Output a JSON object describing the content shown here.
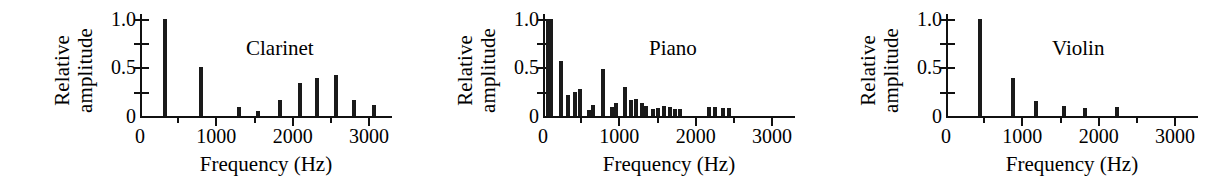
{
  "figure": {
    "background": "#ffffff",
    "ink_color": "#1a1a1a"
  },
  "axis": {
    "ylabel_line1": "Relative",
    "ylabel_line2": "amplitude",
    "xlabel": "Frequency (Hz)",
    "ytick_labels": [
      "1.0",
      "0.5",
      "0"
    ],
    "ytick_values": [
      1.0,
      0.5,
      0
    ],
    "yminor_values": [
      0.75,
      0.25
    ],
    "xtick_labels": [
      "0",
      "1000",
      "2000",
      "3000"
    ],
    "xtick_values": [
      0,
      1000,
      2000,
      3000
    ],
    "xminor_values": [
      500,
      1500,
      2500
    ],
    "xlim": [
      0,
      3300
    ],
    "ylim": [
      0,
      1.05
    ]
  },
  "chart_data": [
    {
      "type": "bar",
      "title": "Clarinet",
      "xlabel": "Frequency (Hz)",
      "ylabel": "Relative amplitude",
      "xlim": [
        0,
        3300
      ],
      "ylim": [
        0,
        1.05
      ],
      "grid": false,
      "x": [
        330,
        800,
        1300,
        1550,
        1830,
        2100,
        2320,
        2570,
        2800,
        3060
      ],
      "values": [
        1.0,
        0.5,
        0.09,
        0.05,
        0.16,
        0.34,
        0.39,
        0.42,
        0.16,
        0.11
      ],
      "categories": [
        "330",
        "800",
        "1300",
        "1550",
        "1830",
        "2100",
        "2320",
        "2570",
        "2800",
        "3060"
      ]
    },
    {
      "type": "bar",
      "title": "Piano",
      "xlabel": "Frequency (Hz)",
      "ylabel": "Relative amplitude",
      "xlim": [
        0,
        3300
      ],
      "ylim": [
        0,
        1.05
      ],
      "grid": false,
      "x": [
        60,
        100,
        230,
        330,
        420,
        490,
        600,
        660,
        790,
        900,
        960,
        1070,
        1150,
        1220,
        1290,
        1350,
        1440,
        1510,
        1590,
        1660,
        1730,
        1800,
        2180,
        2250,
        2360,
        2430
      ],
      "values": [
        1.0,
        1.0,
        0.57,
        0.22,
        0.25,
        0.28,
        0.06,
        0.11,
        0.48,
        0.09,
        0.13,
        0.3,
        0.17,
        0.18,
        0.13,
        0.1,
        0.07,
        0.08,
        0.1,
        0.09,
        0.07,
        0.07,
        0.09,
        0.09,
        0.08,
        0.08
      ],
      "categories": [
        "60",
        "100",
        "230",
        "330",
        "420",
        "490",
        "600",
        "660",
        "790",
        "900",
        "960",
        "1070",
        "1150",
        "1220",
        "1290",
        "1350",
        "1440",
        "1510",
        "1590",
        "1660",
        "1730",
        "1800",
        "2180",
        "2250",
        "2360",
        "2430"
      ]
    },
    {
      "type": "bar",
      "title": "Violin",
      "xlabel": "Frequency (Hz)",
      "ylabel": "Relative amplitude",
      "xlim": [
        0,
        3300
      ],
      "ylim": [
        0,
        1.05
      ],
      "grid": false,
      "x": [
        440,
        880,
        1180,
        1540,
        1820,
        2240
      ],
      "values": [
        1.0,
        0.39,
        0.15,
        0.1,
        0.08,
        0.09
      ],
      "categories": [
        "440",
        "880",
        "1180",
        "1540",
        "1820",
        "2240"
      ]
    }
  ]
}
